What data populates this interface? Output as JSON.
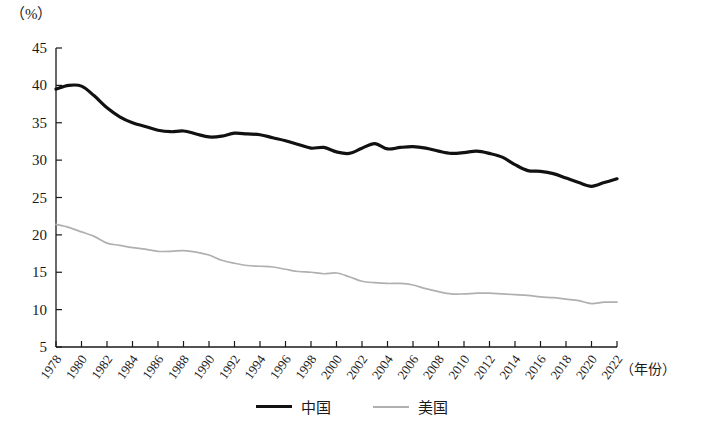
{
  "chart_data": {
    "type": "line",
    "title": "",
    "subtitle": "",
    "unit_label": "（%）",
    "xlabel": "（年份）",
    "ylabel": "",
    "xlim": [
      1978,
      2022
    ],
    "ylim": [
      5,
      45
    ],
    "ytick_step": 5,
    "ytick_labels": [
      "45",
      "40",
      "35",
      "30",
      "25",
      "20",
      "15",
      "10",
      "5"
    ],
    "ytick_values": [
      45,
      40,
      35,
      30,
      25,
      20,
      15,
      10,
      5
    ],
    "xtick_labels": [
      "1978",
      "1980",
      "1982",
      "1984",
      "1986",
      "1988",
      "1990",
      "1992",
      "1994",
      "1996",
      "1998",
      "2000",
      "2002",
      "2004",
      "2006",
      "2008",
      "2010",
      "2012",
      "2014",
      "2016",
      "2018",
      "2020",
      "2022"
    ],
    "xtick_values": [
      1978,
      1980,
      1982,
      1984,
      1986,
      1988,
      1990,
      1992,
      1994,
      1996,
      1998,
      2000,
      2002,
      2004,
      2006,
      2008,
      2010,
      2012,
      2014,
      2016,
      2018,
      2020,
      2022
    ],
    "grid": false,
    "legend_position": "bottom",
    "x": [
      1978,
      1979,
      1980,
      1981,
      1982,
      1983,
      1984,
      1985,
      1986,
      1987,
      1988,
      1989,
      1990,
      1991,
      1992,
      1993,
      1994,
      1995,
      1996,
      1997,
      1998,
      1999,
      2000,
      2001,
      2002,
      2003,
      2004,
      2005,
      2006,
      2007,
      2008,
      2009,
      2010,
      2011,
      2012,
      2013,
      2014,
      2015,
      2016,
      2017,
      2018,
      2019,
      2020,
      2021,
      2022
    ],
    "series": [
      {
        "name": "中国",
        "color": "#111111",
        "width": 3.2,
        "values": [
          39.5,
          40.0,
          39.9,
          38.6,
          37.0,
          35.8,
          35.0,
          34.5,
          34.0,
          33.8,
          33.9,
          33.5,
          33.1,
          33.2,
          33.6,
          33.5,
          33.4,
          33.0,
          32.6,
          32.1,
          31.6,
          31.7,
          31.1,
          30.9,
          31.6,
          32.2,
          31.5,
          31.7,
          31.8,
          31.6,
          31.2,
          30.9,
          31.0,
          31.2,
          30.9,
          30.4,
          29.4,
          28.6,
          28.5,
          28.2,
          27.6,
          27.0,
          26.5,
          27.0,
          27.5
        ]
      },
      {
        "name": "美国",
        "color": "#b0b0b0",
        "width": 1.7,
        "values": [
          21.4,
          21.0,
          20.4,
          19.8,
          18.9,
          18.6,
          18.3,
          18.1,
          17.8,
          17.8,
          17.9,
          17.7,
          17.3,
          16.6,
          16.2,
          15.9,
          15.8,
          15.7,
          15.4,
          15.1,
          15.0,
          14.8,
          14.9,
          14.4,
          13.8,
          13.6,
          13.5,
          13.5,
          13.3,
          12.8,
          12.4,
          12.1,
          12.1,
          12.2,
          12.2,
          12.1,
          12.0,
          11.9,
          11.7,
          11.6,
          11.4,
          11.2,
          10.8,
          11.0,
          11.0
        ]
      }
    ],
    "legend": [
      {
        "name": "中国",
        "color": "#111111",
        "style": "thick-solid"
      },
      {
        "name": "美国",
        "color": "#b0b0b0",
        "style": "thin-solid"
      }
    ]
  },
  "axes": {
    "plot_left": 56,
    "plot_right": 617,
    "plot_top": 48,
    "plot_bottom": 347
  }
}
